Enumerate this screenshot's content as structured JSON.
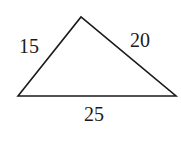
{
  "diagram": {
    "type": "triangle",
    "vertices": {
      "bottom_left": [
        18,
        96
      ],
      "apex": [
        81,
        17
      ],
      "bottom_right": [
        176,
        96
      ]
    },
    "sides": {
      "left": "15",
      "right": "20",
      "base": "25"
    },
    "stroke_color": "#1a1a1a"
  }
}
